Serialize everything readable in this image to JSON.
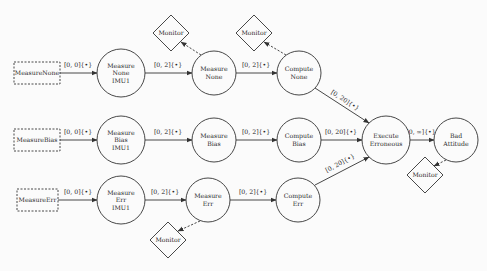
{
  "diagram": {
    "stroke_color": "#333333",
    "background": "#fbfbfb",
    "sources": [
      {
        "id": "src_none",
        "label": "MeasureNone",
        "x": 14,
        "y": 62,
        "w": 46,
        "h": 22
      },
      {
        "id": "src_bias",
        "label": "MeasureBias",
        "x": 14,
        "y": 129,
        "w": 46,
        "h": 22
      },
      {
        "id": "src_err",
        "label": "MeasureErr",
        "x": 17,
        "y": 189,
        "w": 41,
        "h": 22
      }
    ],
    "states": [
      {
        "id": "mn_imu",
        "lines": [
          "Measure",
          "None",
          "IMU1"
        ],
        "cx": 121,
        "cy": 73,
        "r": 24
      },
      {
        "id": "mn",
        "lines": [
          "Measure",
          "None"
        ],
        "cx": 214,
        "cy": 73,
        "r": 22
      },
      {
        "id": "cn",
        "lines": [
          "Compute",
          "None"
        ],
        "cx": 299,
        "cy": 73,
        "r": 22
      },
      {
        "id": "mb_imu",
        "lines": [
          "Measure",
          "Bias",
          "IMU1"
        ],
        "cx": 121,
        "cy": 140,
        "r": 24
      },
      {
        "id": "mb",
        "lines": [
          "Measure",
          "Bias"
        ],
        "cx": 214,
        "cy": 140,
        "r": 22
      },
      {
        "id": "cb",
        "lines": [
          "Compute",
          "Bias"
        ],
        "cx": 299,
        "cy": 140,
        "r": 22
      },
      {
        "id": "ee",
        "lines": [
          "Execute",
          "Erroneous"
        ],
        "cx": 386,
        "cy": 140,
        "r": 24
      },
      {
        "id": "ba",
        "lines": [
          "Bad",
          "Attitude"
        ],
        "cx": 456,
        "cy": 140,
        "r": 22
      },
      {
        "id": "me_imu",
        "lines": [
          "Measure",
          "Err",
          "IMU1"
        ],
        "cx": 121,
        "cy": 200,
        "r": 24
      },
      {
        "id": "me",
        "lines": [
          "Measure",
          "Err"
        ],
        "cx": 208,
        "cy": 200,
        "r": 22
      },
      {
        "id": "ce",
        "lines": [
          "Compute",
          "Err"
        ],
        "cx": 298,
        "cy": 200,
        "r": 22
      }
    ],
    "monitors": [
      {
        "id": "mon1",
        "label": "Monitor",
        "cx": 171,
        "cy": 33,
        "half": 18
      },
      {
        "id": "mon2",
        "label": "Monitor",
        "cx": 254,
        "cy": 33,
        "half": 18
      },
      {
        "id": "mon3",
        "label": "Monitor",
        "cx": 425,
        "cy": 175,
        "half": 18
      },
      {
        "id": "mon4",
        "label": "Monitor",
        "cx": 168,
        "cy": 240,
        "half": 18
      }
    ],
    "edges": [
      {
        "from": "src_none",
        "to": "mn_imu",
        "label": "[0, 0]{•}",
        "x1": 60,
        "y1": 73,
        "x2": 97,
        "y2": 73,
        "lx": 78,
        "ly": 67
      },
      {
        "from": "mn_imu",
        "to": "mn",
        "label": "[0, 2]{•}",
        "x1": 145,
        "y1": 73,
        "x2": 192,
        "y2": 73,
        "lx": 168,
        "ly": 67
      },
      {
        "from": "mn",
        "to": "cn",
        "label": "[0, 2]{•}",
        "x1": 236,
        "y1": 73,
        "x2": 277,
        "y2": 73,
        "lx": 256,
        "ly": 67
      },
      {
        "from": "cn",
        "to": "ee",
        "label": "[0, 20]{•}",
        "x1": 315,
        "y1": 88,
        "x2": 369,
        "y2": 123,
        "lx": 344,
        "ly": 102,
        "rot": 33
      },
      {
        "from": "src_bias",
        "to": "mb_imu",
        "label": "[0, 0]{•}",
        "x1": 60,
        "y1": 140,
        "x2": 97,
        "y2": 140,
        "lx": 78,
        "ly": 134
      },
      {
        "from": "mb_imu",
        "to": "mb",
        "label": "[0, 2]{•}",
        "x1": 145,
        "y1": 140,
        "x2": 192,
        "y2": 140,
        "lx": 168,
        "ly": 134
      },
      {
        "from": "mb",
        "to": "cb",
        "label": "[0, 2]{•}",
        "x1": 236,
        "y1": 140,
        "x2": 277,
        "y2": 140,
        "lx": 256,
        "ly": 134
      },
      {
        "from": "cb",
        "to": "ee",
        "label": "[0, 20]{•}",
        "x1": 321,
        "y1": 140,
        "x2": 362,
        "y2": 140,
        "lx": 341,
        "ly": 134
      },
      {
        "from": "ee",
        "to": "ba",
        "label": "[0, ∞]{•}",
        "x1": 410,
        "y1": 140,
        "x2": 434,
        "y2": 140,
        "lx": 421,
        "ly": 134
      },
      {
        "from": "src_err",
        "to": "me_imu",
        "label": "[0, 0]{•}",
        "x1": 58,
        "y1": 200,
        "x2": 97,
        "y2": 200,
        "lx": 78,
        "ly": 194
      },
      {
        "from": "me_imu",
        "to": "me",
        "label": "[0, 2]{•}",
        "x1": 145,
        "y1": 200,
        "x2": 186,
        "y2": 200,
        "lx": 165,
        "ly": 194
      },
      {
        "from": "me",
        "to": "ce",
        "label": "[0, 2]{•}",
        "x1": 230,
        "y1": 200,
        "x2": 276,
        "y2": 200,
        "lx": 253,
        "ly": 194
      },
      {
        "from": "ce",
        "to": "ee",
        "label": "[0, 20]{•}",
        "x1": 315,
        "y1": 185,
        "x2": 369,
        "y2": 157,
        "lx": 341,
        "ly": 165,
        "rot": -28
      }
    ],
    "monitor_links": [
      {
        "from": "mn",
        "to": "mon1",
        "x1": 201,
        "y1": 55,
        "x2": 181,
        "y2": 42
      },
      {
        "from": "cn",
        "to": "mon2",
        "x1": 286,
        "y1": 55,
        "x2": 264,
        "y2": 42
      },
      {
        "from": "ba",
        "to": "mon3",
        "x1": 446,
        "y1": 160,
        "x2": 434,
        "y2": 166
      },
      {
        "from": "me",
        "to": "mon4",
        "x1": 200,
        "y1": 221,
        "x2": 178,
        "y2": 231
      }
    ]
  }
}
